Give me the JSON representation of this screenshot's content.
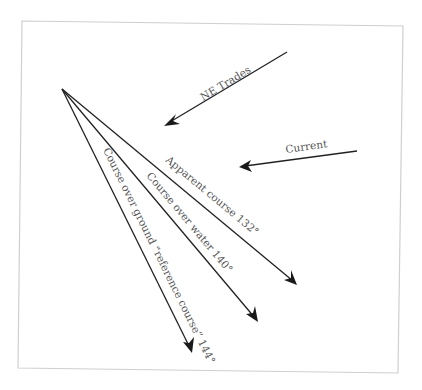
{
  "diagram": {
    "colors": {
      "line": "#222222",
      "text": "#555555",
      "frame": "#cfcfcf",
      "background": "#ffffff"
    },
    "forces": [
      {
        "id": "ne-trades",
        "label": "NE Trades",
        "icon": "arrow-down-left"
      },
      {
        "id": "current",
        "label": "Current",
        "icon": "arrow-left"
      }
    ],
    "courses": [
      {
        "id": "apparent-course",
        "label": "Apparent course 132°",
        "bearing_deg": 132
      },
      {
        "id": "course-over-water",
        "label": "Course over water 140°",
        "bearing_deg": 140
      },
      {
        "id": "course-over-ground",
        "label": "Course over ground “reference course” 144°",
        "bearing_deg": 144
      }
    ]
  }
}
